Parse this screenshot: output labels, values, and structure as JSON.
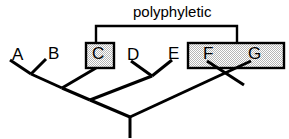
{
  "figure": {
    "annotation_label": "polyphyletic",
    "background_color": "#ffffff",
    "line_color": "#000000",
    "box_fill_color": "#d9d9d9",
    "box_border_color": "#000000"
  },
  "taxa": [
    {
      "id": "A",
      "label": "A",
      "x": 12,
      "y": 56,
      "tip_x": 10,
      "tip_y": 60,
      "boxed": false
    },
    {
      "id": "B",
      "label": "B",
      "x": 48,
      "y": 55,
      "tip_x": 46,
      "tip_y": 59,
      "boxed": false
    },
    {
      "id": "C",
      "label": "C",
      "x": 92,
      "y": 55,
      "tip_x": 96,
      "tip_y": 68,
      "boxed": true
    },
    {
      "id": "D",
      "label": "D",
      "x": 127,
      "y": 56,
      "tip_x": 131,
      "tip_y": 61,
      "boxed": false
    },
    {
      "id": "E",
      "label": "E",
      "x": 168,
      "y": 55,
      "tip_x": 172,
      "tip_y": 60,
      "boxed": false
    },
    {
      "id": "F",
      "label": "F",
      "x": 203,
      "y": 55,
      "tip_x": 207,
      "tip_y": 61,
      "boxed": true
    },
    {
      "id": "G",
      "label": "G",
      "x": 248,
      "y": 55,
      "tip_x": 251,
      "tip_y": 61,
      "boxed": true
    }
  ],
  "highlight_boxes": [
    {
      "id": "box-c",
      "members": [
        "C"
      ],
      "x": 85,
      "y": 42,
      "width": 30,
      "height": 27
    },
    {
      "id": "box-fg",
      "members": [
        "F",
        "G"
      ],
      "x": 187,
      "y": 42,
      "width": 98,
      "height": 27
    }
  ],
  "annotation_bracket": {
    "label": "polyphyletic",
    "label_x": 133,
    "label_y": 5,
    "top_y": 26,
    "left_x": 96,
    "right_x": 237,
    "left_drop_to_y": 42,
    "right_drop_to_y": 42
  },
  "tree_structure": {
    "root": {
      "x": 130,
      "y": 117,
      "stem_bottom_y": 138
    },
    "internal_nodes": [
      {
        "id": "node-ab",
        "x": 31,
        "y": 74
      },
      {
        "id": "node-abc",
        "x": 62,
        "y": 88
      },
      {
        "id": "node-abcde",
        "x": 90,
        "y": 100
      },
      {
        "id": "node-de",
        "x": 152,
        "y": 76
      },
      {
        "id": "node-fg",
        "x": 232,
        "y": 76
      }
    ],
    "description": "Taxa C, F and G are highlighted as a polyphyletic group because their most recent common ancestor also includes D and E, which are not in the group."
  },
  "segments": [
    {
      "name": "branch-a",
      "x1": 10,
      "y1": 60,
      "x2": 31,
      "y2": 74
    },
    {
      "name": "branch-b",
      "x1": 46,
      "y1": 59,
      "x2": 31,
      "y2": 74
    },
    {
      "name": "branch-ab",
      "x1": 31,
      "y1": 74,
      "x2": 62,
      "y2": 88
    },
    {
      "name": "branch-c",
      "x1": 96,
      "y1": 68,
      "x2": 62,
      "y2": 88
    },
    {
      "name": "branch-abc",
      "x1": 62,
      "y1": 88,
      "x2": 90,
      "y2": 100
    },
    {
      "name": "branch-d",
      "x1": 131,
      "y1": 61,
      "x2": 152,
      "y2": 76
    },
    {
      "name": "branch-e",
      "x1": 172,
      "y1": 60,
      "x2": 152,
      "y2": 76
    },
    {
      "name": "branch-de",
      "x1": 152,
      "y1": 76,
      "x2": 90,
      "y2": 100
    },
    {
      "name": "branch-left",
      "x1": 90,
      "y1": 100,
      "x2": 130,
      "y2": 117
    },
    {
      "name": "branch-f",
      "x1": 207,
      "y1": 61,
      "x2": 244,
      "y2": 85
    },
    {
      "name": "branch-g",
      "x1": 251,
      "y1": 61,
      "x2": 130,
      "y2": 117
    },
    {
      "name": "root-stem",
      "x1": 130,
      "y1": 117,
      "x2": 130,
      "y2": 138
    }
  ]
}
